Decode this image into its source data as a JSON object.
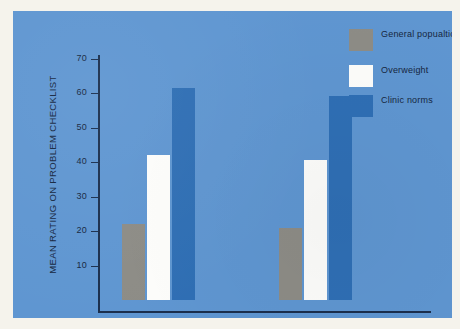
{
  "chart_data": {
    "type": "bar",
    "title": "",
    "xlabel": "",
    "ylabel": "MEAN RATING ON PROBLEM CHECKLIST",
    "categories": [
      "Boys",
      "Girls"
    ],
    "ylim": [
      0,
      75
    ],
    "yticks": [
      10,
      20,
      30,
      40,
      50,
      60,
      70
    ],
    "ytick_labels": [
      "10",
      "20",
      "30",
      "40",
      "50",
      "60",
      "70"
    ],
    "grid": false,
    "legend_position": "top-right",
    "series": [
      {
        "name": "General popualtion",
        "color": "#8d8c86",
        "values": [
          22,
          21
        ]
      },
      {
        "name": "Overweight",
        "color": "#fdfdfb",
        "values": [
          42,
          40.5
        ]
      },
      {
        "name": "Clinic norms",
        "color": "#2f6fb5",
        "values": [
          61.5,
          59
        ]
      }
    ]
  },
  "colors": {
    "plate_background": "#5f96d1",
    "page_background": "#f5f3ec",
    "axis": "#1b2f4d",
    "text": "#16273f",
    "general_population": "#8d8c86",
    "overweight": "#fdfdfb",
    "clinic_norms": "#2f6fb5"
  },
  "legend": {
    "items": [
      {
        "label": "General popualtion",
        "color_key": "general_population"
      },
      {
        "label": "Overweight",
        "color_key": "overweight"
      },
      {
        "label": "Clinic norms",
        "color_key": "clinic_norms"
      }
    ]
  }
}
